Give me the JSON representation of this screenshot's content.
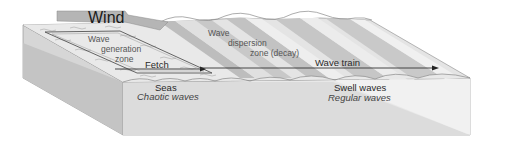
{
  "diagram": {
    "labels": {
      "wind": "Wind",
      "generation_zone_1": "Wave",
      "generation_zone_2": "generation",
      "generation_zone_3": "zone",
      "fetch": "Fetch",
      "dispersion_1": "Wave",
      "dispersion_2": "dispersion",
      "dispersion_3": "zone (decay)",
      "wave_train": "Wave train",
      "seas": "Seas",
      "seas_sub": "Chaotic waves",
      "swell": "Swell waves",
      "swell_sub": "Regular waves"
    },
    "colors": {
      "front_face": "#e6e6e6",
      "side_face": "#cfcfcf",
      "top_light": "#ececec",
      "band_dark": "#bdbdbd",
      "band_mid": "#d4d4d4",
      "wind_arrow": "#b5b5b5",
      "outline": "#8a8a8a",
      "arrow": "#222222"
    }
  }
}
